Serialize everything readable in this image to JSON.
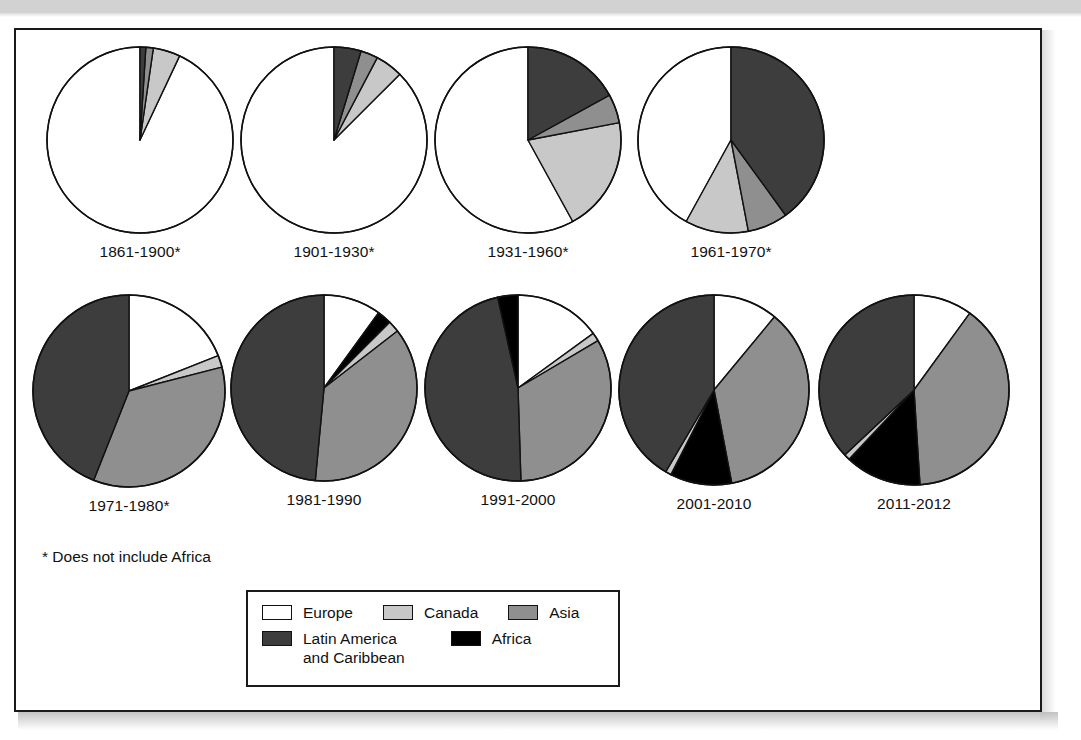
{
  "figure": {
    "footnote": "* Does not include Africa"
  },
  "legend": {
    "rows": [
      [
        {
          "label": "Europe",
          "color": "#ffffff",
          "key": "europe"
        },
        {
          "label": "Canada",
          "color": "#c8c8c8",
          "key": "canada"
        },
        {
          "label": "Asia",
          "color": "#8f8f8f",
          "key": "asia"
        }
      ],
      [
        {
          "label": "Latin America\nand Caribbean",
          "color": "#3d3d3d",
          "key": "latin-america"
        },
        {
          "label": "Africa",
          "color": "#000000",
          "key": "africa"
        }
      ]
    ]
  },
  "colors": {
    "europe": "#ffffff",
    "canada": "#c8c8c8",
    "asia": "#8f8f8f",
    "latin_america": "#3d3d3d",
    "africa": "#000000",
    "outline": "#111111",
    "frame": "#1a1a1a"
  },
  "chart_data": {
    "type": "pie",
    "title": "",
    "subtitle": "",
    "note": "* Does not include Africa",
    "legend_position": "bottom-center",
    "categories": [
      "Europe",
      "Canada",
      "Asia",
      "Latin America and Caribbean",
      "Africa"
    ],
    "units": "percent of total immigration",
    "panels": [
      {
        "label": "1861-1900*",
        "radius": 93,
        "start_angle": -90,
        "direction": "counterclockwise",
        "slices": [
          {
            "name": "Europe",
            "value": 93.0,
            "color": "#ffffff"
          },
          {
            "name": "Canada",
            "value": 4.7,
            "color": "#c8c8c8"
          },
          {
            "name": "Asia",
            "value": 1.3,
            "color": "#8f8f8f"
          },
          {
            "name": "Latin America and Caribbean",
            "value": 1.0,
            "color": "#3d3d3d"
          },
          {
            "name": "Africa",
            "value": 0.0,
            "color": "#000000"
          }
        ]
      },
      {
        "label": "1901-1930*",
        "radius": 93,
        "start_angle": -90,
        "direction": "counterclockwise",
        "slices": [
          {
            "name": "Europe",
            "value": 87.5,
            "color": "#ffffff"
          },
          {
            "name": "Canada",
            "value": 4.8,
            "color": "#c8c8c8"
          },
          {
            "name": "Asia",
            "value": 3.0,
            "color": "#8f8f8f"
          },
          {
            "name": "Latin America and Caribbean",
            "value": 4.7,
            "color": "#3d3d3d"
          },
          {
            "name": "Africa",
            "value": 0.0,
            "color": "#000000"
          }
        ]
      },
      {
        "label": "1931-1960*",
        "radius": 93,
        "start_angle": -90,
        "direction": "counterclockwise",
        "slices": [
          {
            "name": "Europe",
            "value": 58.0,
            "color": "#ffffff"
          },
          {
            "name": "Canada",
            "value": 20.0,
            "color": "#c8c8c8"
          },
          {
            "name": "Asia",
            "value": 5.0,
            "color": "#8f8f8f"
          },
          {
            "name": "Latin America and Caribbean",
            "value": 17.0,
            "color": "#3d3d3d"
          },
          {
            "name": "Africa",
            "value": 0.0,
            "color": "#000000"
          }
        ]
      },
      {
        "label": "1961-1970*",
        "radius": 93,
        "start_angle": -90,
        "direction": "counterclockwise",
        "slices": [
          {
            "name": "Europe",
            "value": 42.0,
            "color": "#ffffff"
          },
          {
            "name": "Canada",
            "value": 11.0,
            "color": "#c8c8c8"
          },
          {
            "name": "Asia",
            "value": 7.0,
            "color": "#8f8f8f"
          },
          {
            "name": "Latin America and Caribbean",
            "value": 40.0,
            "color": "#3d3d3d"
          },
          {
            "name": "Africa",
            "value": 0.0,
            "color": "#000000"
          }
        ]
      },
      {
        "label": "1971-1980*",
        "radius": 96,
        "start_angle": -90,
        "direction": "clockwise",
        "slices": [
          {
            "name": "Europe",
            "value": 19.0,
            "color": "#ffffff"
          },
          {
            "name": "Canada",
            "value": 2.0,
            "color": "#c8c8c8"
          },
          {
            "name": "Asia",
            "value": 35.0,
            "color": "#8f8f8f"
          },
          {
            "name": "Latin America and Caribbean",
            "value": 44.0,
            "color": "#3d3d3d"
          },
          {
            "name": "Africa",
            "value": 0.0,
            "color": "#000000"
          }
        ]
      },
      {
        "label": "1981-1990",
        "radius": 93,
        "start_angle": -90,
        "direction": "clockwise",
        "slices": [
          {
            "name": "Europe",
            "value": 10.0,
            "color": "#ffffff"
          },
          {
            "name": "Africa",
            "value": 2.5,
            "color": "#000000"
          },
          {
            "name": "Canada",
            "value": 2.0,
            "color": "#c8c8c8"
          },
          {
            "name": "Asia",
            "value": 37.0,
            "color": "#8f8f8f"
          },
          {
            "name": "Latin America and Caribbean",
            "value": 48.5,
            "color": "#3d3d3d"
          }
        ]
      },
      {
        "label": "1991-2000",
        "radius": 93,
        "start_angle": -90,
        "direction": "clockwise",
        "slices": [
          {
            "name": "Europe",
            "value": 15.0,
            "color": "#ffffff"
          },
          {
            "name": "Canada",
            "value": 1.5,
            "color": "#c8c8c8"
          },
          {
            "name": "Asia",
            "value": 33.0,
            "color": "#8f8f8f"
          },
          {
            "name": "Latin America and Caribbean",
            "value": 47.0,
            "color": "#3d3d3d"
          },
          {
            "name": "Africa",
            "value": 3.5,
            "color": "#000000"
          }
        ]
      },
      {
        "label": "2001-2010",
        "radius": 95,
        "start_angle": -90,
        "direction": "clockwise",
        "slices": [
          {
            "name": "Europe",
            "value": 11.0,
            "color": "#ffffff"
          },
          {
            "name": "Asia",
            "value": 36.0,
            "color": "#8f8f8f"
          },
          {
            "name": "Africa",
            "value": 10.5,
            "color": "#000000"
          },
          {
            "name": "Canada",
            "value": 1.0,
            "color": "#c8c8c8"
          },
          {
            "name": "Latin America and Caribbean",
            "value": 41.5,
            "color": "#3d3d3d"
          }
        ]
      },
      {
        "label": "2011-2012",
        "radius": 95,
        "start_angle": -90,
        "direction": "clockwise",
        "slices": [
          {
            "name": "Europe",
            "value": 10.0,
            "color": "#ffffff"
          },
          {
            "name": "Asia",
            "value": 39.0,
            "color": "#8f8f8f"
          },
          {
            "name": "Africa",
            "value": 13.0,
            "color": "#000000"
          },
          {
            "name": "Canada",
            "value": 1.0,
            "color": "#c8c8c8"
          },
          {
            "name": "Latin America and Caribbean",
            "value": 37.0,
            "color": "#3d3d3d"
          }
        ]
      }
    ]
  },
  "layout": {
    "row1_x": [
      28,
      222,
      416,
      619
    ],
    "row2_x": [
      14,
      212,
      406,
      600,
      800
    ]
  }
}
